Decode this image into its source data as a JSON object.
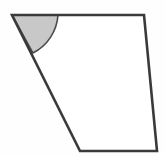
{
  "figure": {
    "canvas": {
      "width": 165,
      "height": 155,
      "background_color": "#fefefe"
    },
    "style": {
      "outline_color": "#3a3a3a",
      "outline_width": 2.6,
      "shape_fill_color": "#ffffff",
      "angle_fill_color": "#c8c8c8",
      "angle_stroke_color": "#4a4a4a",
      "angle_stroke_width": 1.6
    },
    "shape": {
      "name": "quadrilateral",
      "sides": 4,
      "vertices": [
        {
          "label": "top-left",
          "x": 12,
          "y": 15
        },
        {
          "label": "top-right",
          "x": 144,
          "y": 15
        },
        {
          "label": "bottom-right",
          "x": 157,
          "y": 151
        },
        {
          "label": "bottom-left",
          "x": 80,
          "y": 151
        }
      ],
      "path": "M 12 15 L 144 15 L 157 151 L 80 151 Z"
    },
    "angle_marker": {
      "name": "top-left-interior-angle",
      "vertex": {
        "x": 12,
        "y": 15
      },
      "radius": 46,
      "start_point": {
        "x": 58,
        "y": 15
      },
      "end_point": {
        "x": 33,
        "y": 53
      },
      "start_angle_deg": 0,
      "end_angle_deg": 63,
      "sweep_deg": 63,
      "filled": true,
      "path": "M 12 15 L 58 15 A 46 46 0 0 1 32.9 53.0 Z"
    }
  }
}
